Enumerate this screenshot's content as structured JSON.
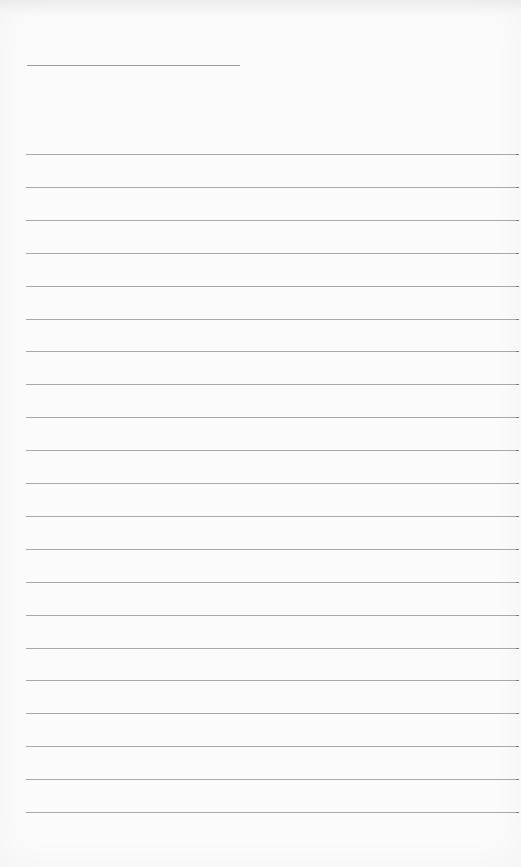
{
  "page": {
    "type": "lined-writing-sheet",
    "background_color": "#fbfbfb",
    "line_color": "#a8a8a8"
  },
  "title_line": {
    "text": "",
    "x": 27,
    "y": 65,
    "width": 213
  },
  "ruled_lines": {
    "count": 21,
    "start_x": 26,
    "end_x": 517,
    "first_y": 154,
    "spacing": 32.9,
    "lines": [
      {
        "text": ""
      },
      {
        "text": ""
      },
      {
        "text": ""
      },
      {
        "text": ""
      },
      {
        "text": ""
      },
      {
        "text": ""
      },
      {
        "text": ""
      },
      {
        "text": ""
      },
      {
        "text": ""
      },
      {
        "text": ""
      },
      {
        "text": ""
      },
      {
        "text": ""
      },
      {
        "text": ""
      },
      {
        "text": ""
      },
      {
        "text": ""
      },
      {
        "text": ""
      },
      {
        "text": ""
      },
      {
        "text": ""
      },
      {
        "text": ""
      },
      {
        "text": ""
      },
      {
        "text": ""
      }
    ]
  }
}
